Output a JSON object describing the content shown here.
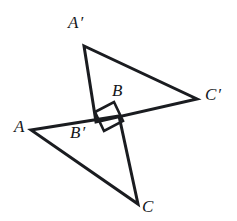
{
  "figure": {
    "stroke_color": "#1a1c20",
    "background_color": "#ffffff",
    "stroke_width": 3,
    "width": 237,
    "height": 221,
    "labels": [
      {
        "id": "A-prime",
        "text": "A",
        "prime": "′",
        "x": 68,
        "y": 14
      },
      {
        "id": "C-prime",
        "text": "C",
        "prime": "′",
        "x": 205,
        "y": 86
      },
      {
        "id": "B",
        "text": "B",
        "prime": "",
        "x": 112,
        "y": 82
      },
      {
        "id": "B-prime",
        "text": "B",
        "prime": "′",
        "x": 70,
        "y": 124
      },
      {
        "id": "A",
        "text": "A",
        "prime": "",
        "x": 14,
        "y": 118
      },
      {
        "id": "C",
        "text": "C",
        "prime": "",
        "x": 142,
        "y": 198
      }
    ],
    "vertices": {
      "A": {
        "x": 31,
        "y": 130
      },
      "B": {
        "x": 119,
        "y": 116
      },
      "C": {
        "x": 138,
        "y": 204
      },
      "A_prime": {
        "x": 84,
        "y": 46
      },
      "B_prime": {
        "x": 96,
        "y": 122
      },
      "C_prime": {
        "x": 197,
        "y": 99
      }
    },
    "triangles": [
      {
        "id": "triangle-ABC",
        "points": "31,130 119,116 138,204"
      },
      {
        "id": "triangle-A-prime-B-prime-C-prime",
        "points": "84,46 96,122 197,99"
      }
    ],
    "right_angle_mark": {
      "id": "right-angle-square",
      "points": "95,112 114,102 123,121 104,131"
    }
  }
}
